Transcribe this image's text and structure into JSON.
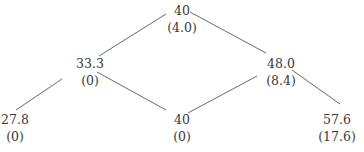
{
  "diagram": {
    "type": "binomial-tree",
    "line_color": "#6a6a6a",
    "text_color": "#3a3a3a",
    "nodes": [
      {
        "id": "root",
        "value": "40",
        "sub": "(4.0)",
        "x": 182,
        "y": 2
      },
      {
        "id": "up",
        "value": "48.0",
        "sub": "(8.4)",
        "x": 281,
        "y": 55
      },
      {
        "id": "down",
        "value": "33.3",
        "sub": "(0)",
        "x": 90,
        "y": 55
      },
      {
        "id": "upup",
        "value": "57.6",
        "sub": "(17.6)",
        "x": 337,
        "y": 111
      },
      {
        "id": "updown",
        "value": "40",
        "sub": "(0)",
        "x": 182,
        "y": 111
      },
      {
        "id": "downdown",
        "value": "27.8",
        "sub": "(0)",
        "x": 15,
        "y": 111
      }
    ],
    "edges": [
      {
        "from": "root",
        "to": "down"
      },
      {
        "from": "root",
        "to": "up"
      },
      {
        "from": "down",
        "to": "downdown"
      },
      {
        "from": "down",
        "to": "updown"
      },
      {
        "from": "up",
        "to": "updown"
      },
      {
        "from": "up",
        "to": "upup"
      }
    ]
  }
}
